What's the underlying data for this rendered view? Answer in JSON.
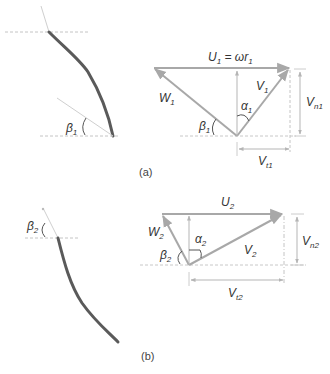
{
  "figure": {
    "panels": [
      {
        "id": "a",
        "caption": "(a)",
        "blade": {
          "angle_label": "β",
          "angle_sub": "1"
        },
        "triangle": {
          "blade_velocity_label": "U",
          "blade_velocity_sub": "1",
          "blade_velocity_expr": " = ωr",
          "blade_velocity_expr_sub": "1",
          "relative_velocity_label": "W",
          "relative_velocity_sub": "1",
          "absolute_velocity_label": "V",
          "absolute_velocity_sub": "1",
          "alpha_label": "α",
          "alpha_sub": "1",
          "beta_label": "β",
          "beta_sub": "1",
          "normal_component_label": "V",
          "normal_component_sub": "n1",
          "tangential_component_label": "V",
          "tangential_component_sub": "t1"
        }
      },
      {
        "id": "b",
        "caption": "(b)",
        "blade": {
          "angle_label": "β",
          "angle_sub": "2"
        },
        "triangle": {
          "blade_velocity_label": "U",
          "blade_velocity_sub": "2",
          "relative_velocity_label": "W",
          "relative_velocity_sub": "2",
          "absolute_velocity_label": "V",
          "absolute_velocity_sub": "2",
          "alpha_label": "α",
          "alpha_sub": "2",
          "beta_label": "β",
          "beta_sub": "2",
          "normal_component_label": "V",
          "normal_component_sub": "n2",
          "tangential_component_label": "V",
          "tangential_component_sub": "t2"
        }
      }
    ],
    "colors": {
      "vector": "#a8a8a8",
      "blade": "#5a5a5a",
      "guide": "#c4c4c4",
      "text": "#333333"
    }
  }
}
